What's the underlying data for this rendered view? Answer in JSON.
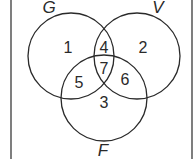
{
  "diagram": {
    "type": "venn",
    "colors": {
      "stroke": "#2a2a2a",
      "background": "#ffffff"
    },
    "sets": [
      {
        "label": "G",
        "cx": 71,
        "cy": 56,
        "r": 43,
        "label_x": 49,
        "label_y": 13
      },
      {
        "label": "V",
        "cx": 137,
        "cy": 56,
        "r": 43,
        "label_x": 158,
        "label_y": 13
      },
      {
        "label": "F",
        "cx": 104,
        "cy": 98,
        "r": 43,
        "label_x": 103,
        "label_y": 156
      }
    ],
    "regions": [
      {
        "label": "1",
        "sets": [
          "G"
        ],
        "x": 68,
        "y": 53
      },
      {
        "label": "2",
        "sets": [
          "V"
        ],
        "x": 143,
        "y": 53
      },
      {
        "label": "3",
        "sets": [
          "F"
        ],
        "x": 104,
        "y": 108
      },
      {
        "label": "4",
        "sets": [
          "G",
          "V"
        ],
        "x": 104,
        "y": 53
      },
      {
        "label": "5",
        "sets": [
          "G",
          "F"
        ],
        "x": 79,
        "y": 88
      },
      {
        "label": "6",
        "sets": [
          "V",
          "F"
        ],
        "x": 125,
        "y": 85
      },
      {
        "label": "7",
        "sets": [
          "G",
          "V",
          "F"
        ],
        "x": 104,
        "y": 74
      }
    ]
  }
}
